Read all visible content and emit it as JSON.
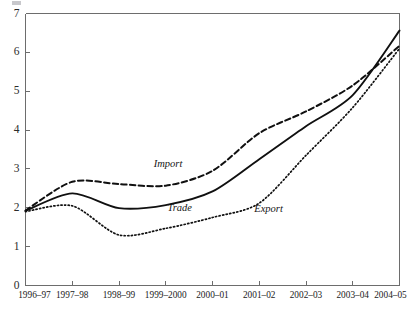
{
  "chart_data": {
    "type": "line",
    "title": "",
    "subtitle": "",
    "xlabel": "",
    "ylabel": "",
    "ylim": [
      0,
      7
    ],
    "ytick_values": [
      0,
      1,
      2,
      3,
      4,
      5,
      6,
      7
    ],
    "ytick_labels": [
      "0",
      "1",
      "2",
      "3",
      "4",
      "5",
      "6",
      "7"
    ],
    "grid": false,
    "legend_position": "inline-annotations",
    "categories": [
      "1996–97",
      "1997–98",
      "1998–99",
      "1999–2000",
      "2000–01",
      "2001–02",
      "2002–03",
      "2003–04",
      "2004–05"
    ],
    "series": [
      {
        "name": "Import",
        "style": "dashed",
        "values": [
          1.93,
          2.67,
          2.61,
          2.57,
          2.95,
          3.92,
          4.48,
          5.15,
          6.17
        ]
      },
      {
        "name": "Trade",
        "style": "solid",
        "values": [
          1.92,
          2.37,
          1.99,
          2.07,
          2.42,
          3.25,
          4.1,
          4.9,
          6.56
        ]
      },
      {
        "name": "Export",
        "style": "dotted",
        "values": [
          1.9,
          2.05,
          1.3,
          1.47,
          1.75,
          2.12,
          3.35,
          4.58,
          6.1
        ]
      }
    ],
    "annotations": [
      {
        "text": "Import",
        "x_value": 3.05,
        "y_value": 3.06
      },
      {
        "text": "Trade",
        "x_value": 3.3,
        "y_value": 1.92
      },
      {
        "text": "Export",
        "x_value": 5.2,
        "y_value": 1.88
      }
    ],
    "axis_color": "#6d6d6d",
    "series_color": "#101010",
    "background_color": "#ffffff"
  }
}
